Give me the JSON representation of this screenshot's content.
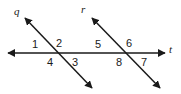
{
  "figure": {
    "type": "geometry-diagram",
    "background_color": "#ffffff",
    "stroke_color": "#1a1a1a",
    "text_color": "#1a1a1a",
    "width": 181,
    "height": 94
  },
  "lines": [
    {
      "id": "line-q",
      "label": "q",
      "label_x": 14,
      "label_y": 6,
      "x1": 25,
      "y1": 18,
      "x2": 92,
      "y2": 88,
      "arrow_start": true,
      "arrow_end": true
    },
    {
      "id": "line-r",
      "label": "r",
      "label_x": 81,
      "label_y": 4,
      "x1": 92,
      "y1": 18,
      "x2": 160,
      "y2": 88,
      "arrow_start": true,
      "arrow_end": true
    },
    {
      "id": "line-t",
      "label": "t",
      "label_x": 169,
      "label_y": 44,
      "x1": 8,
      "y1": 53,
      "x2": 165,
      "y2": 53,
      "arrow_start": true,
      "arrow_end": true
    }
  ],
  "intersections": [
    {
      "id": "intersection-q-t",
      "x": 57,
      "y": 53
    },
    {
      "id": "intersection-r-t",
      "x": 127,
      "y": 53
    }
  ],
  "angles": [
    {
      "id": "angle-1",
      "label": "1",
      "x": 32,
      "y": 39
    },
    {
      "id": "angle-2",
      "label": "2",
      "x": 56,
      "y": 38
    },
    {
      "id": "angle-3",
      "label": "3",
      "x": 72,
      "y": 57
    },
    {
      "id": "angle-4",
      "label": "4",
      "x": 47,
      "y": 57
    },
    {
      "id": "angle-5",
      "label": "5",
      "x": 95,
      "y": 39
    },
    {
      "id": "angle-6",
      "label": "6",
      "x": 126,
      "y": 38
    },
    {
      "id": "angle-7",
      "label": "7",
      "x": 141,
      "y": 57
    },
    {
      "id": "angle-8",
      "label": "8",
      "x": 116,
      "y": 57
    }
  ]
}
